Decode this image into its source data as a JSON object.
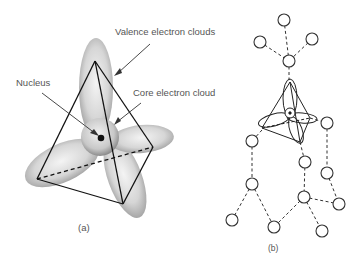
{
  "panel_a": {
    "labels": {
      "valence": "Valence electron clouds",
      "nucleus": "Nucleus",
      "core": "Core electron cloud"
    },
    "caption": "(a)"
  },
  "panel_b": {
    "caption": "(b)"
  }
}
